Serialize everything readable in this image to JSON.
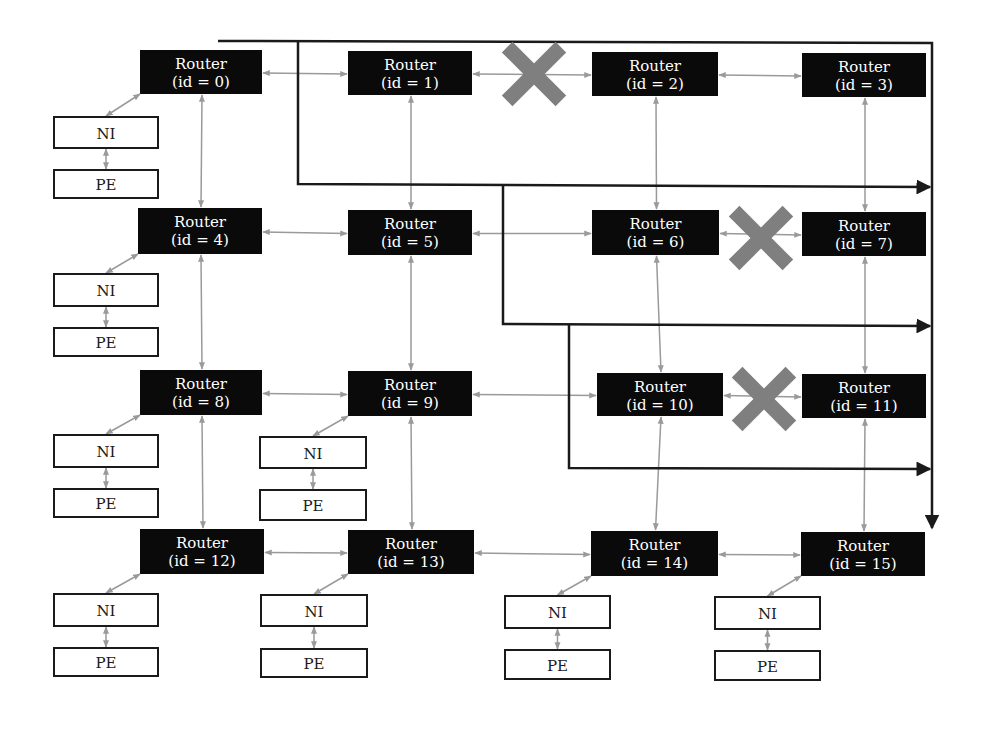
{
  "diagram": {
    "colors": {
      "router": "#0a0a0a",
      "router_text": "#ffffff",
      "link": "#9a9a9a",
      "path": "#1a1a1a",
      "fault": "#7f7f7f",
      "box_border": "#1a1a1a"
    },
    "routers": [
      {
        "id": 0,
        "line1": "Router",
        "line2": "(id = 0)",
        "x": 140,
        "y": 50,
        "w": 122,
        "h": 44
      },
      {
        "id": 1,
        "line1": "Router",
        "line2": "(id = 1)",
        "x": 348,
        "y": 51,
        "w": 124,
        "h": 44
      },
      {
        "id": 2,
        "line1": "Router",
        "line2": "(id = 2)",
        "x": 592,
        "y": 52,
        "w": 126,
        "h": 44
      },
      {
        "id": 3,
        "line1": "Router",
        "line2": "(id = 3)",
        "x": 802,
        "y": 53,
        "w": 124,
        "h": 44
      },
      {
        "id": 4,
        "line1": "Router",
        "line2": "(id = 4)",
        "x": 138,
        "y": 208,
        "w": 124,
        "h": 46
      },
      {
        "id": 5,
        "line1": "Router",
        "line2": "(id = 5)",
        "x": 348,
        "y": 210,
        "w": 124,
        "h": 45
      },
      {
        "id": 6,
        "line1": "Router",
        "line2": "(id = 6)",
        "x": 592,
        "y": 210,
        "w": 127,
        "h": 45
      },
      {
        "id": 7,
        "line1": "Router",
        "line2": "(id = 7)",
        "x": 802,
        "y": 212,
        "w": 124,
        "h": 44
      },
      {
        "id": 8,
        "line1": "Router",
        "line2": "(id = 8)",
        "x": 140,
        "y": 370,
        "w": 122,
        "h": 45
      },
      {
        "id": 9,
        "line1": "Router",
        "line2": "(id = 9)",
        "x": 348,
        "y": 371,
        "w": 124,
        "h": 45
      },
      {
        "id": 10,
        "line1": "Router",
        "line2": "(id = 10)",
        "x": 597,
        "y": 373,
        "w": 126,
        "h": 43
      },
      {
        "id": 11,
        "line1": "Router",
        "line2": "(id = 11)",
        "x": 802,
        "y": 374,
        "w": 124,
        "h": 44
      },
      {
        "id": 12,
        "line1": "Router",
        "line2": "(id = 12)",
        "x": 140,
        "y": 529,
        "w": 124,
        "h": 45
      },
      {
        "id": 13,
        "line1": "Router",
        "line2": "(id = 13)",
        "x": 348,
        "y": 530,
        "w": 126,
        "h": 44
      },
      {
        "id": 14,
        "line1": "Router",
        "line2": "(id = 14)",
        "x": 591,
        "y": 531,
        "w": 127,
        "h": 45
      },
      {
        "id": 15,
        "line1": "Router",
        "line2": "(id = 15)",
        "x": 801,
        "y": 532,
        "w": 124,
        "h": 44
      }
    ],
    "endpoints": [
      {
        "router": 0,
        "ni": {
          "label": "NI",
          "x": 54,
          "y": 117,
          "w": 104,
          "h": 31
        },
        "pe": {
          "label": "PE",
          "x": 54,
          "y": 170,
          "w": 104,
          "h": 28
        }
      },
      {
        "router": 4,
        "ni": {
          "label": "NI",
          "x": 54,
          "y": 274,
          "w": 104,
          "h": 32
        },
        "pe": {
          "label": "PE",
          "x": 54,
          "y": 328,
          "w": 104,
          "h": 28
        }
      },
      {
        "router": 8,
        "ni": {
          "label": "NI",
          "x": 54,
          "y": 435,
          "w": 104,
          "h": 32
        },
        "pe": {
          "label": "PE",
          "x": 54,
          "y": 489,
          "w": 104,
          "h": 28
        }
      },
      {
        "router": 9,
        "ni": {
          "label": "NI",
          "x": 260,
          "y": 437,
          "w": 106,
          "h": 31
        },
        "pe": {
          "label": "PE",
          "x": 260,
          "y": 490,
          "w": 106,
          "h": 30
        }
      },
      {
        "router": 12,
        "ni": {
          "label": "NI",
          "x": 54,
          "y": 594,
          "w": 104,
          "h": 32
        },
        "pe": {
          "label": "PE",
          "x": 54,
          "y": 648,
          "w": 104,
          "h": 28
        }
      },
      {
        "router": 13,
        "ni": {
          "label": "NI",
          "x": 261,
          "y": 595,
          "w": 106,
          "h": 31
        },
        "pe": {
          "label": "PE",
          "x": 261,
          "y": 649,
          "w": 106,
          "h": 28
        }
      },
      {
        "router": 14,
        "ni": {
          "label": "NI",
          "x": 505,
          "y": 596,
          "w": 105,
          "h": 32
        },
        "pe": {
          "label": "PE",
          "x": 505,
          "y": 650,
          "w": 105,
          "h": 29
        }
      },
      {
        "router": 15,
        "ni": {
          "label": "NI",
          "x": 715,
          "y": 597,
          "w": 105,
          "h": 32
        },
        "pe": {
          "label": "PE",
          "x": 715,
          "y": 651,
          "w": 105,
          "h": 29
        }
      }
    ],
    "faulty_links": [
      {
        "between": [
          1,
          2
        ],
        "cx": 534,
        "cy": 74,
        "size": 38
      },
      {
        "between": [
          6,
          7
        ],
        "cx": 761,
        "cy": 238,
        "size": 38
      },
      {
        "between": [
          10,
          11
        ],
        "cx": 764,
        "cy": 399,
        "size": 38
      }
    ],
    "routing_paths": [
      {
        "points": [
          [
            218,
            41
          ],
          [
            932,
            43
          ],
          [
            932,
            528
          ]
        ],
        "arrow": "down"
      },
      {
        "points": [
          [
            298,
            41
          ],
          [
            298,
            184
          ],
          [
            930,
            187
          ]
        ],
        "arrow": "right"
      },
      {
        "points": [
          [
            503,
            184
          ],
          [
            503,
            324
          ],
          [
            930,
            326
          ]
        ],
        "arrow": "right"
      },
      {
        "points": [
          [
            569,
            324
          ],
          [
            569,
            468
          ],
          [
            930,
            469
          ]
        ],
        "arrow": "right"
      }
    ]
  }
}
